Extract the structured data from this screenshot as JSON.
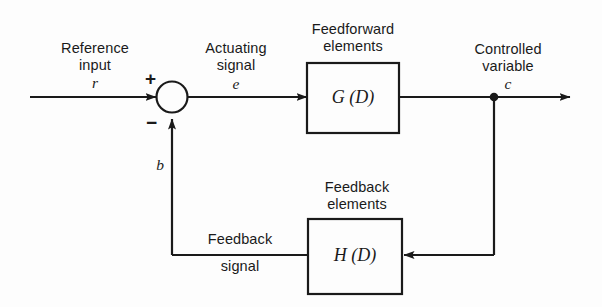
{
  "diagram": {
    "background_color": "#fdfdfd",
    "line_color": "#1a1a1a",
    "labels": {
      "reference_input_line1": "Reference",
      "reference_input_line2": "input",
      "reference_symbol": "r",
      "actuating_line1": "Actuating",
      "actuating_line2": "signal",
      "actuating_symbol": "e",
      "feedforward_line1": "Feedforward",
      "feedforward_line2": "elements",
      "feedforward_block": "G (D)",
      "controlled_line1": "Controlled",
      "controlled_line2": "variable",
      "controlled_symbol": "c",
      "feedback_elements_line1": "Feedback",
      "feedback_elements_line2": "elements",
      "feedback_block": "H (D)",
      "feedback_signal_line1": "Feedback",
      "feedback_signal_line2": "signal",
      "feedback_symbol": "b",
      "plus_sign": "+",
      "minus_sign": "−"
    }
  }
}
